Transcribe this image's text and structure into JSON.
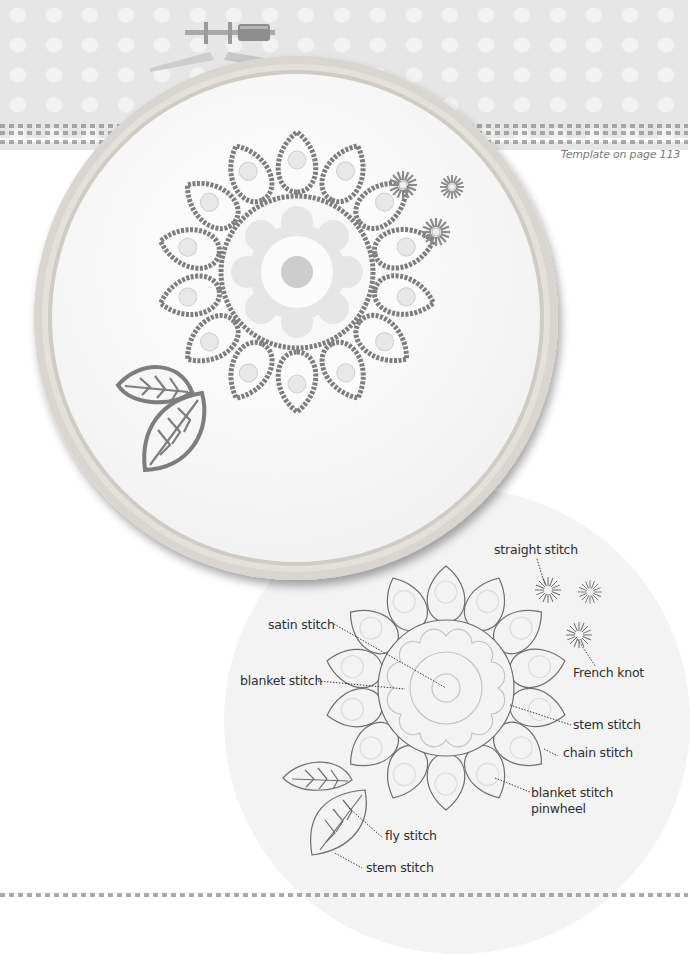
{
  "page": {
    "template_note": "Template on page 113"
  },
  "photo": {
    "subject": "embroidery-hoop-with-flower-design",
    "colors": {
      "hoop_wood": "#d6d2cc",
      "fabric": "#fafafa",
      "thread_dark": "#7d7d7d",
      "thread_light": "#c8c8c8",
      "background_band": "#e6e6e6"
    }
  },
  "diagram": {
    "labels": {
      "straight_stitch": "straight stitch",
      "french_knot": "French knot",
      "satin_stitch": "satin stitch",
      "blanket_stitch": "blanket stitch",
      "stem_stitch_1": "stem stitch",
      "chain_stitch": "chain stitch",
      "blanket_stitch_pinwheel_1": "blanket stitch",
      "blanket_stitch_pinwheel_2": "pinwheel",
      "fly_stitch": "fly stitch",
      "stem_stitch_2": "stem stitch"
    },
    "colors": {
      "circle_bg": "#f3f3f3",
      "outline": "#6e6e6e",
      "inner_outline": "#c4c4c4",
      "text": "#2e2e2e"
    }
  }
}
